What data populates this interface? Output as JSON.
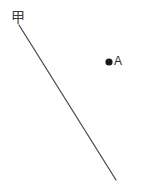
{
  "figure": {
    "width": 142,
    "height": 191,
    "background_color": "#ffffff",
    "line": {
      "label": "甲",
      "label_color": "#3b3b3b",
      "stroke_color": "#444444",
      "stroke_width": 1.2,
      "x1": 19,
      "y1": 25,
      "x2": 116,
      "y2": 180
    },
    "point": {
      "label": "A",
      "label_color": "#2b2b2b",
      "fill_color": "#1a1a1a",
      "cx": 109,
      "cy": 62,
      "r": 3.6
    }
  }
}
